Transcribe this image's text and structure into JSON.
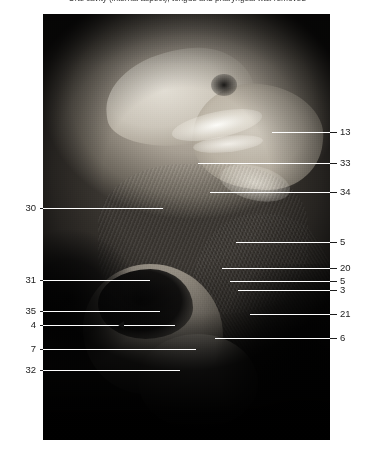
{
  "caption": "Oral cavity (internal aspect), tongue and pharyngeal wall removed",
  "plate": {
    "alt_name": "anatomical-dissection-photograph"
  },
  "labels_left": [
    {
      "number": "30",
      "y": 208,
      "line_end_x": 163
    },
    {
      "number": "31",
      "y": 280,
      "line_end_x": 150
    },
    {
      "number": "35",
      "y": 311,
      "line_end_x": 160
    },
    {
      "number": "4",
      "y": 325,
      "line_end_x": 175
    },
    {
      "number": "7",
      "y": 349,
      "line_end_x": 196
    },
    {
      "number": "32",
      "y": 370,
      "line_end_x": 180
    }
  ],
  "labels_right": [
    {
      "number": "13",
      "y": 132,
      "line_start_x": 272
    },
    {
      "number": "33",
      "y": 163,
      "line_start_x": 198
    },
    {
      "number": "34",
      "y": 192,
      "line_start_x": 210
    },
    {
      "number": "5",
      "y": 242,
      "line_start_x": 236
    },
    {
      "number": "20",
      "y": 268,
      "line_start_x": 222
    },
    {
      "number": "5",
      "y": 281,
      "line_start_x": 230
    },
    {
      "number": "3",
      "y": 290,
      "line_start_x": 238
    },
    {
      "number": "21",
      "y": 314,
      "line_start_x": 250
    },
    {
      "number": "6",
      "y": 338,
      "line_start_x": 215
    }
  ],
  "colors": {
    "text": "#1c1c1c",
    "caption": "#3a3a3a",
    "leader_dark": "#1e1e1e",
    "leader_light": "#ffffff",
    "page_background": "#ffffff",
    "plate_dark": "#0a0a0a"
  }
}
